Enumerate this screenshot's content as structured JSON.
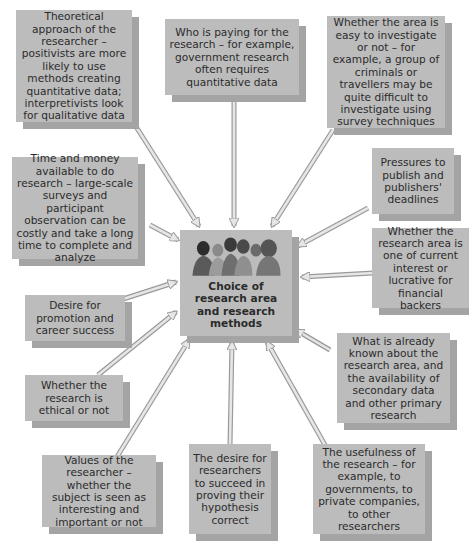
{
  "center": {
    "label": "Choice of research area and research methods",
    "icon": "people-group-icon"
  },
  "factors": [
    {
      "id": "theoretical-approach",
      "text": "Theoretical approach of the researcher – positivists are more likely to use methods creating quantitative data; interpretivists look for qualitative data"
    },
    {
      "id": "who-is-paying",
      "text": "Who is paying for the research – for example, government research often requires quantitative data"
    },
    {
      "id": "easy-to-investigate",
      "text": "Whether the area is easy to investigate or not – for example, a group of criminals or travellers may be quite difficult to investigate using survey techniques"
    },
    {
      "id": "time-and-money",
      "text": "Time and money available to do research – large-scale surveys and participant observation can be costly and take a long time to complete and analyze"
    },
    {
      "id": "pressures-to-publish",
      "text": "Pressures to publish and publishers' deadlines"
    },
    {
      "id": "current-interest",
      "text": "Whether the research area is one of current interest or lucrative for financial backers"
    },
    {
      "id": "desire-for-promotion",
      "text": "Desire for promotion and career success"
    },
    {
      "id": "already-known",
      "text": "What is already known about the research area, and the availability of secondary data and other primary research"
    },
    {
      "id": "ethical",
      "text": "Whether the research is ethical or not"
    },
    {
      "id": "values-of-researcher",
      "text": "Values of the researcher – whether the subject is seen as interesting and important or not"
    },
    {
      "id": "desire-to-succeed",
      "text": "The desire for researchers to succeed in proving their hypothesis correct"
    },
    {
      "id": "usefulness",
      "text": "The usefulness of the research – for example, to governments, to private companies, to other researchers"
    }
  ],
  "colors": {
    "box": "#bcbcbc",
    "shadow": "#a4a4a4",
    "arrow_fill": "#e6e6e6",
    "arrow_stroke": "#9a9a9a",
    "text": "#2b2b2b"
  }
}
